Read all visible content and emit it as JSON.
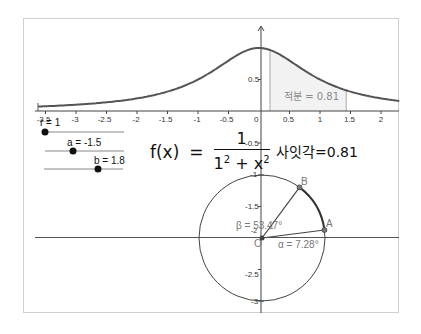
{
  "graph": {
    "function_label": "f(x)",
    "equals": "=",
    "numerator": "1",
    "denominator_base": "1",
    "denominator_exp": "2",
    "denominator_plus": " + x",
    "denominator_x_exp": "2",
    "origin_px": [
      259,
      111
    ],
    "unit_px": [
      61,
      63
    ],
    "x_range": [
      -3.62,
      2.3
    ],
    "x_ticks": [
      "-3.5",
      "-3",
      "-2.5",
      "-2",
      "-1.5",
      "-1",
      "-0.5",
      "0",
      "0.5",
      "1",
      "1.5",
      "2"
    ],
    "x_tick_values": [
      -3.5,
      -3,
      -2.5,
      -2,
      -1.5,
      -1,
      -0.5,
      0,
      0.5,
      1,
      1.5,
      2
    ],
    "y_tick_label_05": "0.5",
    "y_tick_label_neg05": "-0.5",
    "shade_from": 0.18,
    "shade_to": 1.43,
    "integral_label": "적분 = 0.81",
    "curve_color": "#555555",
    "shade_color": "#f2f2f2"
  },
  "sliders": [
    {
      "label": "r = 1",
      "value": 1
    },
    {
      "label": "a = -1.5",
      "value": -1.5
    },
    {
      "label": "b = 1.8",
      "value": 1.8
    }
  ],
  "angle_display": "사잇각=0.81",
  "circle": {
    "center_label": "O",
    "point_a_label": "A",
    "point_b_label": "B",
    "alpha_label": "α = 7.28°",
    "beta_label": "β = 53.47°",
    "alpha_deg": 7.28,
    "beta_deg": 53.47,
    "y_ticks": [
      "-1",
      "-1.5",
      "-2",
      "-2.5",
      "-3"
    ]
  }
}
